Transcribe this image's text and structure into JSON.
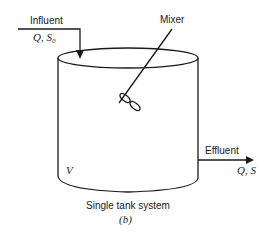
{
  "diagram": {
    "influent": {
      "label": "Influent",
      "vars": "Q, S₀"
    },
    "mixer": {
      "label": "Mixer"
    },
    "effluent": {
      "label": "Effluent",
      "vars": "Q, S"
    },
    "tank": {
      "volume_label": "V"
    },
    "caption": {
      "title": "Single tank system",
      "sublabel": "(b)"
    }
  }
}
